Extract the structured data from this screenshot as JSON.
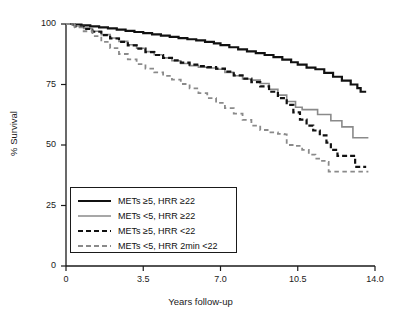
{
  "chart_data": {
    "type": "line",
    "title": "",
    "xlabel": "Years follow-up",
    "ylabel": "% Survival",
    "xlim": [
      0,
      14.0
    ],
    "ylim": [
      0,
      100
    ],
    "xticks": [
      "0",
      "3.5",
      "7.0",
      "10.5",
      "14.0"
    ],
    "xtick_values": [
      0,
      3.5,
      7.0,
      10.5,
      14.0
    ],
    "yticks": [
      "0",
      "25",
      "50",
      "75",
      "100"
    ],
    "ytick_values": [
      0,
      25,
      50,
      75,
      100
    ],
    "grid": false,
    "legend_position": "lower-left-inside",
    "series": [
      {
        "name": "METs ≥5, HRR ≥22",
        "color": "#111111",
        "style": "solid",
        "width": 2.2,
        "final_value": 72,
        "points": [
          [
            0.0,
            100
          ],
          [
            0.3,
            99.8
          ],
          [
            0.7,
            99.4
          ],
          [
            1.1,
            99.0
          ],
          [
            1.5,
            98.6
          ],
          [
            1.9,
            98.2
          ],
          [
            2.3,
            97.7
          ],
          [
            2.7,
            97.2
          ],
          [
            3.1,
            96.7
          ],
          [
            3.5,
            96.2
          ],
          [
            3.9,
            95.7
          ],
          [
            4.3,
            95.2
          ],
          [
            4.7,
            94.7
          ],
          [
            5.1,
            94.2
          ],
          [
            5.5,
            93.7
          ],
          [
            5.9,
            93.2
          ],
          [
            6.3,
            92.6
          ],
          [
            6.7,
            92.0
          ],
          [
            7.0,
            91.3
          ],
          [
            7.4,
            90.4
          ],
          [
            7.8,
            89.5
          ],
          [
            8.2,
            88.7
          ],
          [
            8.6,
            88.0
          ],
          [
            9.0,
            87.2
          ],
          [
            9.4,
            86.3
          ],
          [
            9.8,
            85.3
          ],
          [
            10.2,
            84.2
          ],
          [
            10.5,
            83.2
          ],
          [
            10.9,
            82.0
          ],
          [
            11.3,
            81.3
          ],
          [
            11.7,
            79.8
          ],
          [
            12.1,
            78.2
          ],
          [
            12.5,
            76.6
          ],
          [
            12.9,
            75.0
          ],
          [
            13.2,
            73.5
          ],
          [
            13.35,
            72.0
          ],
          [
            13.6,
            72.0
          ]
        ]
      },
      {
        "name": "METs <5, HRR ≥22",
        "color": "#8a8a8a",
        "style": "solid",
        "width": 1.6,
        "final_value": 53,
        "points": [
          [
            0.0,
            100
          ],
          [
            0.4,
            99.2
          ],
          [
            0.8,
            98.2
          ],
          [
            1.2,
            97.0
          ],
          [
            1.6,
            95.6
          ],
          [
            2.0,
            94.2
          ],
          [
            2.4,
            92.8
          ],
          [
            2.8,
            91.4
          ],
          [
            3.2,
            90.0
          ],
          [
            3.6,
            88.6
          ],
          [
            4.0,
            87.3
          ],
          [
            4.4,
            86.0
          ],
          [
            4.8,
            84.8
          ],
          [
            5.2,
            83.7
          ],
          [
            5.6,
            82.8
          ],
          [
            6.0,
            82.2
          ],
          [
            6.4,
            81.8
          ],
          [
            6.8,
            81.3
          ],
          [
            7.2,
            80.0
          ],
          [
            7.6,
            78.6
          ],
          [
            8.0,
            77.3
          ],
          [
            8.4,
            76.8
          ],
          [
            8.8,
            75.4
          ],
          [
            9.2,
            73.0
          ],
          [
            9.6,
            70.6
          ],
          [
            10.0,
            68.0
          ],
          [
            10.4,
            65.6
          ],
          [
            10.7,
            64.6
          ],
          [
            11.3,
            64.6
          ],
          [
            11.4,
            62.6
          ],
          [
            11.9,
            62.6
          ],
          [
            12.0,
            60.0
          ],
          [
            12.4,
            60.0
          ],
          [
            12.5,
            57.5
          ],
          [
            12.9,
            57.5
          ],
          [
            13.0,
            53.0
          ],
          [
            13.7,
            53.0
          ]
        ]
      },
      {
        "name": "METs ≥5, HRR <22",
        "color": "#111111",
        "style": "dashed",
        "width": 2.2,
        "final_value": 41,
        "points": [
          [
            0.0,
            100
          ],
          [
            0.4,
            99.0
          ],
          [
            0.8,
            98.0
          ],
          [
            1.2,
            96.8
          ],
          [
            1.6,
            95.4
          ],
          [
            2.0,
            94.0
          ],
          [
            2.4,
            92.6
          ],
          [
            2.8,
            91.2
          ],
          [
            3.2,
            89.8
          ],
          [
            3.6,
            88.4
          ],
          [
            4.0,
            87.2
          ],
          [
            4.4,
            86.0
          ],
          [
            4.8,
            85.0
          ],
          [
            5.2,
            84.0
          ],
          [
            5.6,
            83.2
          ],
          [
            6.0,
            82.6
          ],
          [
            6.4,
            82.2
          ],
          [
            6.8,
            81.6
          ],
          [
            7.2,
            80.3
          ],
          [
            7.6,
            78.8
          ],
          [
            8.0,
            77.4
          ],
          [
            8.4,
            76.0
          ],
          [
            8.8,
            74.2
          ],
          [
            9.2,
            72.0
          ],
          [
            9.6,
            69.4
          ],
          [
            10.0,
            66.6
          ],
          [
            10.3,
            63.5
          ],
          [
            10.6,
            60.5
          ],
          [
            10.9,
            58.0
          ],
          [
            11.2,
            56.0
          ],
          [
            11.5,
            54.0
          ],
          [
            11.8,
            51.0
          ],
          [
            12.0,
            48.0
          ],
          [
            12.3,
            45.5
          ],
          [
            12.9,
            45.5
          ],
          [
            13.0,
            45.5
          ],
          [
            13.1,
            41.0
          ],
          [
            13.6,
            41.0
          ]
        ]
      },
      {
        "name": "METs <5, HRR 2min <22",
        "color": "#8a8a8a",
        "style": "dashed",
        "width": 1.8,
        "final_value": 39,
        "points": [
          [
            0.0,
            100
          ],
          [
            0.4,
            98.6
          ],
          [
            0.8,
            97.0
          ],
          [
            1.2,
            95.0
          ],
          [
            1.6,
            92.6
          ],
          [
            2.0,
            90.0
          ],
          [
            2.4,
            87.6
          ],
          [
            2.8,
            85.4
          ],
          [
            3.2,
            83.4
          ],
          [
            3.6,
            81.6
          ],
          [
            4.0,
            80.0
          ],
          [
            4.4,
            78.6
          ],
          [
            4.8,
            77.0
          ],
          [
            5.2,
            75.2
          ],
          [
            5.6,
            73.4
          ],
          [
            6.0,
            71.4
          ],
          [
            6.4,
            69.4
          ],
          [
            6.8,
            67.4
          ],
          [
            7.2,
            65.2
          ],
          [
            7.6,
            63.0
          ],
          [
            8.0,
            60.4
          ],
          [
            8.4,
            58.0
          ],
          [
            8.8,
            56.2
          ],
          [
            9.2,
            55.2
          ],
          [
            9.6,
            54.6
          ],
          [
            9.9,
            54.4
          ],
          [
            10.0,
            50.0
          ],
          [
            10.4,
            49.6
          ],
          [
            10.7,
            48.0
          ],
          [
            11.0,
            46.0
          ],
          [
            11.3,
            44.4
          ],
          [
            11.6,
            43.4
          ],
          [
            11.8,
            43.0
          ],
          [
            11.9,
            39.0
          ],
          [
            13.7,
            39.0
          ]
        ]
      }
    ]
  },
  "axes": {
    "ylabel": "% Survival",
    "xlabel": "Years follow-up",
    "yticks": [
      "100",
      "75",
      "50",
      "25",
      "0"
    ],
    "xticks": [
      "0",
      "3.5",
      "7.0",
      "10.5",
      "14.0"
    ]
  },
  "legend": {
    "items": [
      {
        "label": "METs ≥5, HRR ≥22",
        "style": "solid-black"
      },
      {
        "label": "METs <5, HRR ≥22",
        "style": "solid-gray"
      },
      {
        "label": "METs ≥5, HRR <22",
        "style": "dashed-black"
      },
      {
        "label": "METs <5, HRR 2min <22",
        "style": "dashed-gray"
      }
    ]
  }
}
